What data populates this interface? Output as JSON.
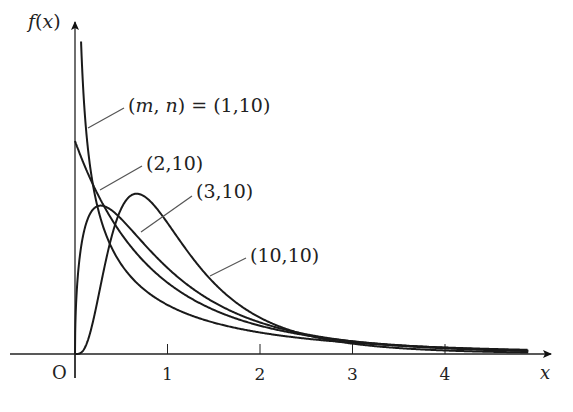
{
  "chart_data": {
    "type": "line",
    "title": "",
    "xlabel": "x",
    "ylabel": "f(x)",
    "origin_label": "O",
    "xticks": [
      1,
      2,
      3,
      4
    ],
    "xtick_labels": [
      "1",
      "2",
      "3",
      "4"
    ],
    "xlim": [
      0,
      5
    ],
    "ylim": [
      0,
      1.55
    ],
    "grid": false,
    "legend": "inline annotations with leader lines",
    "series": [
      {
        "name": "(m,n) = (1,10)",
        "m": 1,
        "n": 10,
        "label": "(m, n) = (1,10)",
        "shape": "decreasing, unbounded at 0"
      },
      {
        "name": "(2,10)",
        "m": 2,
        "n": 10,
        "label": "(2,10)",
        "shape": "decreasing from f(0)=1"
      },
      {
        "name": "(3,10)",
        "m": 3,
        "n": 10,
        "label": "(3,10)",
        "mode_x": 0.28,
        "peak_y": 0.69
      },
      {
        "name": "(10,10)",
        "m": 10,
        "n": 10,
        "label": "(10,10)",
        "mode_x": 0.67,
        "peak_y": 0.73
      }
    ]
  },
  "labels": {
    "y_axis": "f(x)",
    "x_axis": "x",
    "origin": "O",
    "s1": "(m, n) = (1,10)",
    "s2": "(2,10)",
    "s3": "(3,10)",
    "s4": "(10,10)"
  }
}
